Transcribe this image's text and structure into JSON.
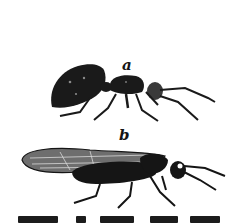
{
  "figure": {
    "labels": {
      "a": "a",
      "b": "b"
    },
    "items": [
      {
        "id": "a",
        "subject": "wingless ant-like insect (side view)"
      },
      {
        "id": "b",
        "subject": "winged insect with veined wings (side view)"
      }
    ],
    "caption_visible": false,
    "colors": {
      "ink": "#141414",
      "paper": "#ffffff"
    }
  }
}
